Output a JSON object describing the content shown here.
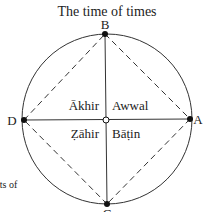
{
  "title": "The time of times",
  "points": {
    "A": "A",
    "B": "B",
    "C": "C",
    "D": "D"
  },
  "quadrants": {
    "top_left": "Ākhir",
    "top_right": "Awwal",
    "bottom_left": "Ẓāhir",
    "bottom_right": "Bāṭin"
  },
  "fragment_text": "its of"
}
